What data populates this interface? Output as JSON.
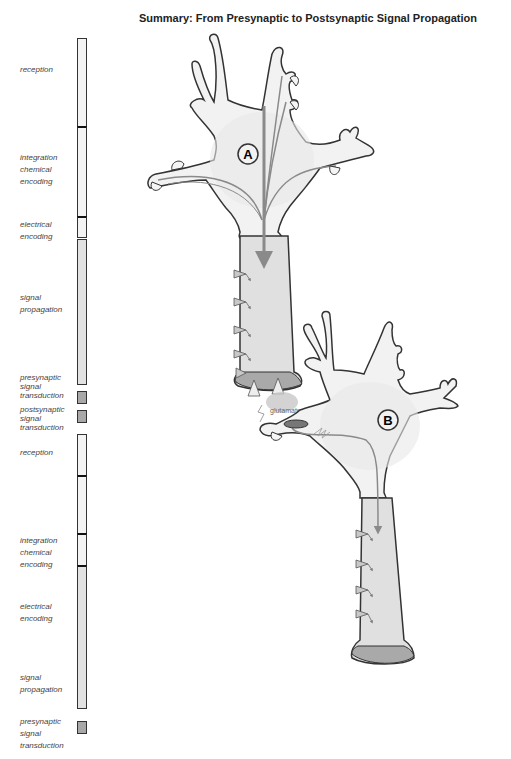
{
  "title": "Summary: From Presynaptic to Postsynaptic Signal Propagation",
  "neurons": {
    "a": {
      "label": "A"
    },
    "b": {
      "label": "B"
    }
  },
  "synapse": {
    "transmitter_label": "glutamate"
  },
  "stages_upper": [
    {
      "lines": [
        "reception"
      ]
    },
    {
      "lines": [
        "integration",
        "chemical",
        "encoding"
      ]
    },
    {
      "lines": [
        "electrical",
        "encoding"
      ]
    },
    {
      "lines": [
        "signal",
        "propagation"
      ]
    },
    {
      "lines": [
        "presynaptic",
        "signal",
        "transduction"
      ]
    },
    {
      "lines": [
        "postsynaptic",
        "signal",
        "transduction"
      ]
    }
  ],
  "stages_lower": [
    {
      "lines": [
        "reception"
      ]
    },
    {
      "lines": [
        "integration",
        "chemical",
        "encoding"
      ]
    },
    {
      "lines": [
        "electrical",
        "encoding"
      ]
    },
    {
      "lines": [
        "signal",
        "propagation"
      ]
    },
    {
      "lines": [
        "presynaptic",
        "signal",
        "transduction"
      ]
    }
  ],
  "colors": {
    "outline": "#333333",
    "cell_fill": "#f2f2f2",
    "axon_fill": "#e0e0e0",
    "terminal_fill": "#a9a9a9",
    "arrow": "#8a8a8a"
  }
}
